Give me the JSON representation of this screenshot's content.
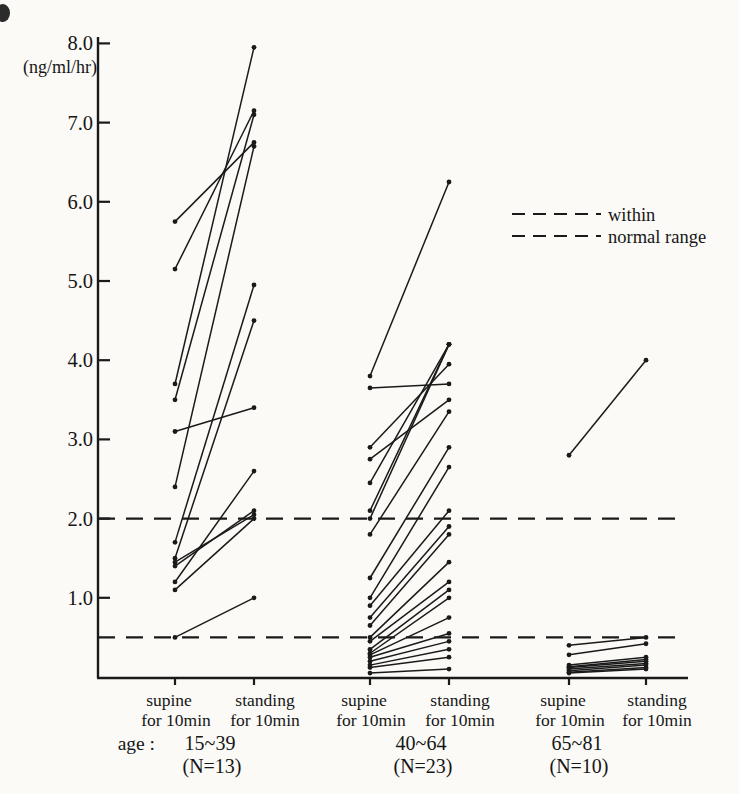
{
  "chart_data": {
    "type": "line",
    "subtype": "paired-slope-chart",
    "unit_label": "(ng/ml/hr)",
    "ylim": [
      0,
      8.3
    ],
    "grid": false,
    "y_ticks": [
      {
        "value": 8,
        "label": "8.0"
      },
      {
        "value": 7,
        "label": "7.0"
      },
      {
        "value": 6,
        "label": "6.0"
      },
      {
        "value": 5,
        "label": "5.0"
      },
      {
        "value": 4,
        "label": "4.0"
      },
      {
        "value": 3,
        "label": "3.0"
      },
      {
        "value": 2,
        "label": "2.0"
      },
      {
        "value": 1,
        "label": "1.0"
      }
    ],
    "normal_range": {
      "low": 0.5,
      "high": 2.0,
      "style": "dashed"
    },
    "legend": {
      "position": "right-upper",
      "line1": "within",
      "line2": "normal range"
    },
    "condition_labels": {
      "left_top": "supine",
      "left_bottom": "for 10min",
      "right_top": "standing",
      "right_bottom": "for 10min"
    },
    "age_prefix": "age :",
    "groups": [
      {
        "age_label": "15~39",
        "n_label": "(N=13)",
        "n": 13,
        "pairs": [
          [
            5.75,
            6.75
          ],
          [
            5.15,
            7.15
          ],
          [
            3.7,
            7.95
          ],
          [
            3.5,
            7.1
          ],
          [
            3.1,
            3.4
          ],
          [
            2.4,
            6.7
          ],
          [
            1.7,
            4.95
          ],
          [
            1.5,
            4.5
          ],
          [
            1.45,
            2.05
          ],
          [
            1.4,
            2.1
          ],
          [
            1.2,
            2.6
          ],
          [
            1.1,
            2.0
          ],
          [
            0.5,
            1.0
          ]
        ]
      },
      {
        "age_label": "40~64",
        "n_label": "(N=23)",
        "n": 23,
        "pairs": [
          [
            3.8,
            6.25
          ],
          [
            3.65,
            3.7
          ],
          [
            2.9,
            3.95
          ],
          [
            2.75,
            3.5
          ],
          [
            2.45,
            4.2
          ],
          [
            2.1,
            4.2
          ],
          [
            2.0,
            4.2
          ],
          [
            1.8,
            3.35
          ],
          [
            1.25,
            2.9
          ],
          [
            1.0,
            2.65
          ],
          [
            0.9,
            2.1
          ],
          [
            0.75,
            1.9
          ],
          [
            0.65,
            1.8
          ],
          [
            0.5,
            1.45
          ],
          [
            0.45,
            1.2
          ],
          [
            0.35,
            1.1
          ],
          [
            0.3,
            1.0
          ],
          [
            0.28,
            0.75
          ],
          [
            0.25,
            0.55
          ],
          [
            0.2,
            0.45
          ],
          [
            0.15,
            0.35
          ],
          [
            0.12,
            0.25
          ],
          [
            0.05,
            0.1
          ]
        ]
      },
      {
        "age_label": "65~81",
        "n_label": "(N=10)",
        "n": 10,
        "pairs": [
          [
            2.8,
            4.0
          ],
          [
            0.4,
            0.5
          ],
          [
            0.28,
            0.42
          ],
          [
            0.15,
            0.25
          ],
          [
            0.13,
            0.22
          ],
          [
            0.12,
            0.2
          ],
          [
            0.1,
            0.17
          ],
          [
            0.08,
            0.15
          ],
          [
            0.06,
            0.12
          ],
          [
            0.05,
            0.1
          ]
        ]
      }
    ]
  }
}
